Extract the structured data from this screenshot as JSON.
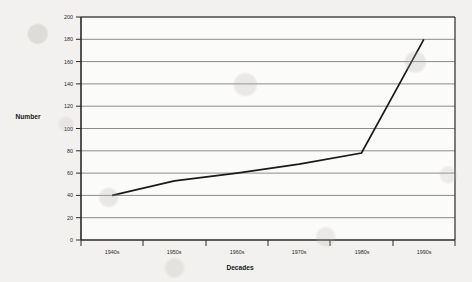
{
  "chart_data": {
    "type": "line",
    "title": "",
    "xlabel": "Decades",
    "ylabel": "Number",
    "categories": [
      "1940s",
      "1950s",
      "1960s",
      "1970s",
      "1980s",
      "1990s"
    ],
    "values": [
      40,
      53,
      60,
      68,
      78,
      180
    ],
    "series": [
      {
        "name": "Number",
        "values": [
          40,
          53,
          60,
          68,
          78,
          180
        ]
      }
    ],
    "ylim": [
      0,
      200
    ],
    "y_ticks": [
      0,
      20,
      40,
      60,
      80,
      100,
      120,
      140,
      160,
      180,
      200
    ],
    "y_tick_labels": [
      "0",
      "20",
      "40",
      "60",
      "80",
      "100",
      "120",
      "140",
      "160",
      "180",
      "200"
    ],
    "x_tick_labels": [
      "1940s",
      "1950s",
      "1960s",
      "1970s",
      "1980s",
      "1990s"
    ],
    "grid": "horizontal",
    "legend": "none",
    "annotations": [],
    "colors": {
      "line": "#1a1a1a",
      "gridline": "#8c8c8c",
      "axis": "#2a2a2a",
      "plot_background": "#fbfbfa",
      "page_background": "#f2f1ef",
      "text": "#171717"
    }
  },
  "axis_titles": {
    "y": "Number",
    "x": "Decades"
  }
}
